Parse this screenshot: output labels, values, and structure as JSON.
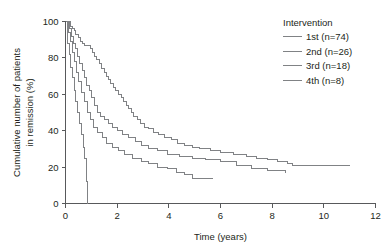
{
  "chart_data": {
    "type": "line",
    "title": "",
    "xlabel": "Time (years)",
    "ylabel": "Cumulative number of patients in remission (%)",
    "ylabel_line1": "Cumulative number of patients",
    "ylabel_line2": "in remission (%)",
    "xlim": [
      0,
      12
    ],
    "ylim": [
      0,
      100
    ],
    "xticks": [
      0,
      2,
      4,
      6,
      8,
      10,
      12
    ],
    "xtick_labels": [
      "0",
      "2",
      "4",
      "6",
      "8",
      "10",
      "12"
    ],
    "yticks": [
      0,
      20,
      40,
      60,
      80,
      100
    ],
    "ytick_labels": [
      "0",
      "20",
      "40",
      "60",
      "80",
      "100"
    ],
    "grid": false,
    "legend_position": "top-right",
    "legend_title": "Intervention",
    "series": [
      {
        "name": "1st (n=74)",
        "label": "1st",
        "n": 74,
        "color": "#808285",
        "step": "post",
        "points": [
          [
            0.0,
            100
          ],
          [
            0.18,
            97
          ],
          [
            0.26,
            96
          ],
          [
            0.33,
            95
          ],
          [
            0.4,
            93
          ],
          [
            0.5,
            91
          ],
          [
            0.58,
            89
          ],
          [
            0.66,
            88
          ],
          [
            0.74,
            87
          ],
          [
            0.84,
            87
          ],
          [
            0.95,
            85
          ],
          [
            1.05,
            83
          ],
          [
            1.12,
            81
          ],
          [
            1.2,
            79
          ],
          [
            1.3,
            77
          ],
          [
            1.4,
            74
          ],
          [
            1.5,
            72
          ],
          [
            1.58,
            70
          ],
          [
            1.66,
            68
          ],
          [
            1.75,
            66
          ],
          [
            1.85,
            64
          ],
          [
            1.95,
            62
          ],
          [
            2.05,
            60
          ],
          [
            2.15,
            58
          ],
          [
            2.25,
            56
          ],
          [
            2.35,
            54
          ],
          [
            2.45,
            52
          ],
          [
            2.55,
            50
          ],
          [
            2.65,
            48
          ],
          [
            2.78,
            46
          ],
          [
            2.9,
            44
          ],
          [
            3.05,
            42
          ],
          [
            3.2,
            41
          ],
          [
            3.4,
            39
          ],
          [
            3.6,
            38
          ],
          [
            3.85,
            36
          ],
          [
            4.1,
            35
          ],
          [
            4.35,
            33
          ],
          [
            4.6,
            32
          ],
          [
            4.9,
            31
          ],
          [
            5.2,
            30
          ],
          [
            5.6,
            29
          ],
          [
            6.0,
            28
          ],
          [
            6.5,
            27
          ],
          [
            7.0,
            26
          ],
          [
            7.4,
            25
          ],
          [
            7.8,
            24
          ],
          [
            8.2,
            23
          ],
          [
            8.6,
            22
          ],
          [
            8.8,
            21
          ],
          [
            11.0,
            21
          ]
        ]
      },
      {
        "name": "2nd (n=26)",
        "label": "2nd",
        "n": 26,
        "color": "#808285",
        "step": "post",
        "points": [
          [
            0.0,
            100
          ],
          [
            0.14,
            96
          ],
          [
            0.22,
            92
          ],
          [
            0.3,
            88
          ],
          [
            0.38,
            85
          ],
          [
            0.46,
            81
          ],
          [
            0.55,
            77
          ],
          [
            0.64,
            73
          ],
          [
            0.73,
            69
          ],
          [
            0.82,
            65
          ],
          [
            0.92,
            62
          ],
          [
            1.02,
            58
          ],
          [
            1.12,
            54
          ],
          [
            1.24,
            50
          ],
          [
            1.36,
            48
          ],
          [
            1.5,
            46
          ],
          [
            1.65,
            44
          ],
          [
            1.82,
            42
          ],
          [
            2.0,
            40
          ],
          [
            2.2,
            38
          ],
          [
            2.45,
            36
          ],
          [
            2.7,
            34
          ],
          [
            2.95,
            32
          ],
          [
            3.2,
            30
          ],
          [
            3.55,
            29
          ],
          [
            3.95,
            27
          ],
          [
            4.4,
            26
          ],
          [
            4.9,
            25
          ],
          [
            5.4,
            24
          ],
          [
            6.0,
            23
          ],
          [
            6.6,
            21
          ],
          [
            7.2,
            19
          ],
          [
            7.8,
            18
          ],
          [
            8.5,
            17
          ],
          [
            8.5,
            17
          ]
        ]
      },
      {
        "name": "3rd (n=18)",
        "label": "3rd",
        "n": 18,
        "color": "#808285",
        "step": "post",
        "points": [
          [
            0.0,
            100
          ],
          [
            0.1,
            94
          ],
          [
            0.18,
            89
          ],
          [
            0.26,
            83
          ],
          [
            0.34,
            78
          ],
          [
            0.42,
            72
          ],
          [
            0.52,
            67
          ],
          [
            0.62,
            61
          ],
          [
            0.72,
            56
          ],
          [
            0.84,
            50
          ],
          [
            0.96,
            46
          ],
          [
            1.1,
            42
          ],
          [
            1.25,
            39
          ],
          [
            1.42,
            36
          ],
          [
            1.6,
            33
          ],
          [
            1.8,
            31
          ],
          [
            2.05,
            29
          ],
          [
            2.3,
            27
          ],
          [
            2.6,
            25
          ],
          [
            2.95,
            23
          ],
          [
            3.2,
            22
          ],
          [
            3.55,
            20
          ],
          [
            3.95,
            19
          ],
          [
            4.3,
            17
          ],
          [
            4.6,
            16
          ],
          [
            4.9,
            14
          ],
          [
            5.7,
            14
          ]
        ]
      },
      {
        "name": "4th (n=8)",
        "label": "4th",
        "n": 8,
        "color": "#808285",
        "step": "post",
        "points": [
          [
            0.0,
            100
          ],
          [
            0.08,
            88
          ],
          [
            0.14,
            82
          ],
          [
            0.2,
            75
          ],
          [
            0.26,
            69
          ],
          [
            0.33,
            62
          ],
          [
            0.4,
            56
          ],
          [
            0.48,
            50
          ],
          [
            0.56,
            44
          ],
          [
            0.62,
            38
          ],
          [
            0.68,
            31
          ],
          [
            0.74,
            25
          ],
          [
            0.8,
            12
          ],
          [
            0.85,
            0
          ]
        ]
      }
    ]
  },
  "axes": {
    "x_title": "Time (years)",
    "y_title_line1": "Cumulative number of patients",
    "y_title_line2": "in remission (%)"
  },
  "legend": {
    "title": "Intervention",
    "items": [
      {
        "label": "1st (n=74)",
        "color": "#808285"
      },
      {
        "label": "2nd (n=26)",
        "color": "#808285"
      },
      {
        "label": "3rd (n=18)",
        "color": "#808285"
      },
      {
        "label": "4th (n=8)",
        "color": "#808285"
      }
    ]
  },
  "style": {
    "axis_color": "#58595b",
    "text_color": "#231f20",
    "curve_color": "#808285",
    "background": "#ffffff"
  }
}
